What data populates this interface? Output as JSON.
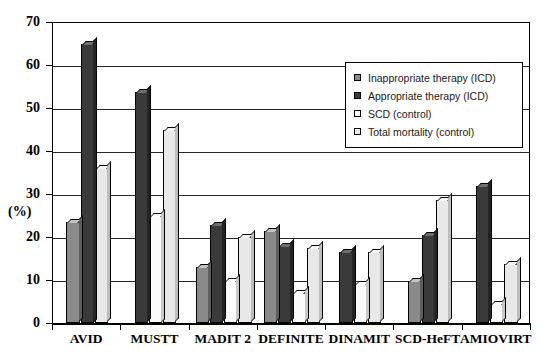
{
  "chart_data": {
    "type": "bar",
    "title": "",
    "xlabel": "",
    "ylabel": "(%)",
    "ylim": [
      0,
      70
    ],
    "yticks": [
      0,
      10,
      20,
      30,
      40,
      50,
      60,
      70
    ],
    "grid": true,
    "legend_position": "upper-right",
    "categories": [
      "AVID",
      "MUSTT",
      "MADIT 2",
      "DEFINITE",
      "DINAMIT",
      "SCD-HeFT",
      "AMIOVIRT"
    ],
    "series": [
      {
        "name": "Inappropriate therapy (ICD)",
        "color": "#8a8a8a",
        "values": [
          23.5,
          null,
          13.0,
          21.5,
          null,
          9.8,
          null
        ]
      },
      {
        "name": "Appropriate therapy (ICD)",
        "color": "#3a3a3a",
        "values": [
          65.0,
          53.8,
          22.8,
          18.0,
          16.5,
          20.5,
          31.8
        ]
      },
      {
        "name": "SCD (control)",
        "color": "#fbfbfb",
        "values": [
          null,
          25.0,
          9.8,
          7.0,
          9.0,
          null,
          4.5
        ]
      },
      {
        "name": "Total mortality (control)",
        "color": "#e8e8e8",
        "values": [
          36.0,
          44.8,
          20.0,
          17.5,
          16.5,
          28.7,
          13.8
        ]
      }
    ]
  },
  "legend": {
    "items": [
      {
        "label": "Inappropriate therapy (ICD)",
        "swatch": "legend-swatch-inappropriate"
      },
      {
        "label": "Appropriate therapy (ICD)",
        "swatch": "legend-swatch-appropriate"
      },
      {
        "label": "SCD (control)",
        "swatch": "legend-swatch-scd"
      },
      {
        "label": "Total mortality (control)",
        "swatch": "legend-swatch-total-mortality"
      }
    ]
  },
  "axis": {
    "y_title": "(%)",
    "y_labels": [
      "70",
      "60",
      "50",
      "40",
      "30",
      "20",
      "10",
      "0"
    ],
    "x_labels": [
      "AVID",
      "MUSTT",
      "MADIT 2",
      "DEFINITE",
      "DINAMIT",
      "SCD-HeFT",
      "AMIOVIRT"
    ]
  }
}
